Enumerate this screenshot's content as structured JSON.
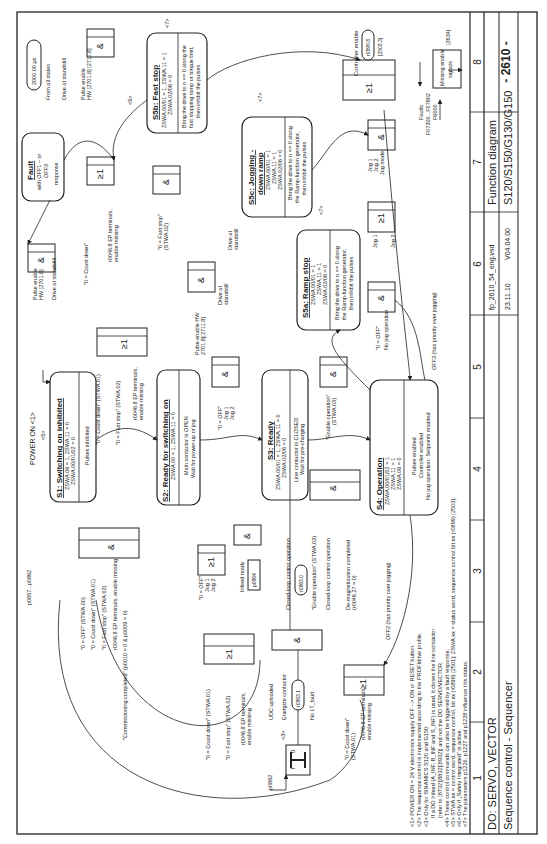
{
  "title_block": {
    "do_label": "DO: SERVO, VECTOR",
    "subtitle": "Sequence control - Sequencer",
    "file": "fp_2610_54_eng.vsd",
    "date": "23.11.10",
    "version": "V04.04.00",
    "doc_type": "Function diagram",
    "products": "S120/S150/G130/G150",
    "page": "- 2610 -",
    "columns": [
      "1",
      "2",
      "3",
      "4",
      "5",
      "6",
      "7",
      "8"
    ]
  },
  "footnotes": [
    "<1> POWER ON = 24 V electronics supply OFF --> ON or RESET button.",
    "<2> The sequence control is implemented according to the PROFIdrive profile.",
    "<3> Only for SINAMICS S120 and G150:",
    "If a DO Infeed (A_INF, B_INF and S_INF) is used, it closes the line contactor",
    "(refer to [8732][8832][8932]) and not the DO SERVO/VECTOR.",
    "<4> These control commands can also be triggered by a fault response.",
    "<5> STWA.xx = control word, sequence control, bit xx (r0898) [2501]; ZSWA.xx = status word, sequence control bit xx (r0899) [2503].",
    "<6> Only if „Safety Integrated“ is active.",
    "<7> The parameters p1226, p1227 and p1228 influence this status."
  ],
  "states": {
    "s1": {
      "title": "S1: Switching on inhibited",
      "cond1": "ZSWA.06 = 1, ZSWA.11 = 0",
      "cond2": "ZSWA.00/01/02 = 0",
      "desc": "Pulses inhibited"
    },
    "s2": {
      "title": "S2: Ready for switching on",
      "cond1": "ZSWA.00 = 1, ZSWA.11 = 0",
      "desc1": "Main contactor is OPEN",
      "desc2": "Wait for power-up or jog"
    },
    "s3": {
      "title": "S3: Ready",
      "cond1": "ZSWA.00/01 = 1, ZSWA.11 = 0",
      "cond2": "ZSWA.02/06 = 0",
      "desc1": "Line contactor is CLOSED",
      "desc2": "Wait for pre-charging"
    },
    "s4": {
      "title": "S4: Operation",
      "cond1": "ZSWA.00/01/02 = 1",
      "cond2": "ZSWA.11 = 1",
      "cond3": "ZSWA.06 = 0",
      "desc1": "Pulses enabled",
      "desc2": "Controller enabled",
      "desc3": "No jog operation: Setpoints enabled"
    },
    "s5a": {
      "title": "S5a: Ramp stop",
      "cond1": "ZSWA.00/01 = 1",
      "cond2": "ZSWA.11 = 1",
      "cond3": "ZSWA.02/06 = 0",
      "desc1": "Bring the drive to n <= 0 along",
      "desc2": "the Ramp-function generator,",
      "desc3": "then inhibit the pulses"
    },
    "s5b": {
      "title": "S5b: Fast stop",
      "cond1": "ZSWA.00/01 = 1, ZSWA.11 = 1",
      "cond2": "ZSWA.02/06 = 0",
      "desc1": "Bring the drive to n <= 0 along the",
      "desc2": "fast stopping ramp or torque limit,",
      "desc3": "then inhibit the pulses"
    },
    "s5c": {
      "title1": "S5c: Jogging -",
      "title2": "down ramp",
      "cond1": "ZSWA.00/01 = 1",
      "cond2": "ZSWA.11 = 1",
      "cond3": "ZSWA.02/06 = 0",
      "desc1": "Bring the drive to n <= 0 along",
      "desc2": "the Ramp-function generator,",
      "desc3": "then inhibit the pulses"
    },
    "fault": {
      "title": "Fault",
      "desc1": "with OFF1 – or",
      "desc2": "OFF3",
      "desc3": "response"
    }
  },
  "labels": {
    "power_on": "POWER ON <1>",
    "n5": "<5>",
    "n7": "<7>",
    "n4n5": "<4> <5>",
    "n6": "<6>",
    "n3": "<3>",
    "ref2634": "[2634]",
    "time": "2000.00 µs",
    "from_all": "From all states",
    "dots": ". . .",
    "drive_standstill": "Drive at standstill",
    "drive_at": "Drive at",
    "standstill": "standstill",
    "pulse_enable": "Pulse enable",
    "hw_2701": "HW [2701.8]",
    "hw_2701_2711": "HW [2701.8] [2711.8]",
    "pulse_enable_hw": "Pulse enable HW",
    "ref_2701_2711": "2701.8][2711.8]",
    "off0": "\"0 = OFF\" (STWA.00)",
    "coast01": "\"0 = Coast down\" (STWA.01)",
    "fast02": "\"0 = Fast stop\" (STWA.02)",
    "ep_missing": "r0046.8 EP terminals, enable missing",
    "ep_terminals": "r0046.8 EP terminals,",
    "enable_missing": "enable missing",
    "commissioning": "\"Commissioning completed\" (p0010 = 0 & p0009 = 0)",
    "off_simple": "\"0 = OFF\"",
    "jog1": "Jog 1",
    "jog2": "Jog 2",
    "jog_mode": "Jog mode",
    "infeed_ready": "Infeed ready",
    "p0864": "p0864",
    "p0857": "p0857...p0862",
    "p0862": "p0862",
    "cl_op": "Closed-loop control operation",
    "r0863_0": "r0863.0",
    "r0863_1": "r0863.1",
    "enable_op": "\"Enable operation\" (STWA.03)",
    "enable_op_q": "\"Enable operation\"",
    "stwa03": "(STWA.03)",
    "demag": "De-magnetization completed",
    "demag2": "(r0046.27 = 0)",
    "udc": "UDC uploaded",
    "energize": "Energize contactor",
    "no_lt": "No LT_fault",
    "off2": "OFF2 (has priority over jogging)",
    "off3": "OFF3 (has priority over jogging)",
    "no_jog": "No jog operation",
    "fast_stop_q": "\"0 = Fast stop\"",
    "stwa02": "(STWA.02)",
    "coast_q": "\"0 = Coast down\"",
    "stwa01": "(STWA.01)",
    "controller_enable": "Controller enable",
    "r0899_8": "r0899.8",
    "ref2503": "[2503.3]",
    "faults": "Faults",
    "faults_codes": "F07300...F07802",
    "f6000": "F6000",
    "missing_enable": "Missing enable",
    "signals": "signals",
    "and": "&",
    "or": "≥1",
    "timer_t": "T",
    "timer_0": "0"
  }
}
